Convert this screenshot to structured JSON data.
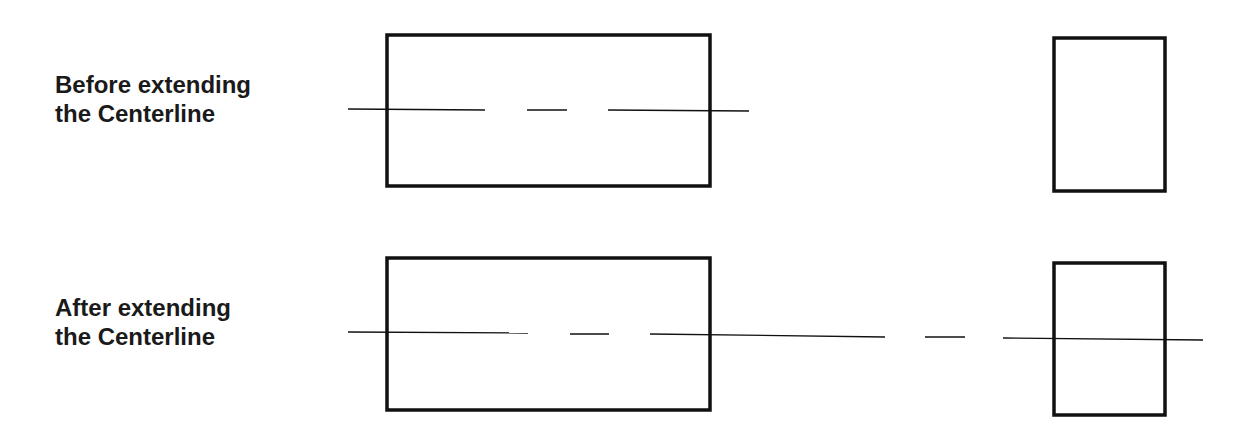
{
  "rows": [
    {
      "label_line1": "Before extending",
      "label_line2": "the Centerline"
    },
    {
      "label_line1": "After extending",
      "label_line2": "the Centerline"
    }
  ],
  "colors": {
    "stroke": "#111111",
    "text": "#1a1a1a",
    "background": "#ffffff"
  }
}
